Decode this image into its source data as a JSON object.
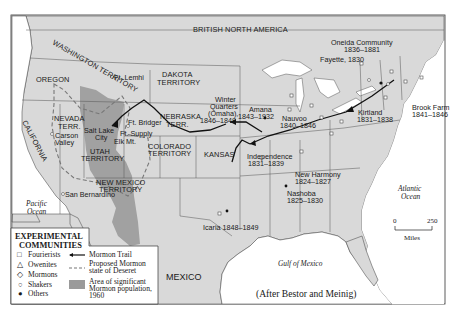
{
  "map": {
    "colors": {
      "land": "#d9d9d9",
      "water": "#ffffff",
      "border": "#555555",
      "mormon_area": "#9a9a9a",
      "trail": "#111111"
    },
    "regions": {
      "british_north_america": "BRITISH NORTH AMERICA",
      "washington": "WASHINGTON TERRITORY",
      "oregon": "OREGON",
      "dakota_1": "DAKOTA",
      "dakota_2": "TERRITORY",
      "nevada_1": "NEVADA",
      "nevada_2": "TERR.",
      "nebraska_1": "NEBRASKA",
      "nebraska_2": "TERR.",
      "utah_1": "UTAH",
      "utah_2": "TERRITORY",
      "colorado_1": "COLORADO",
      "colorado_2": "TERRITORY",
      "kansas": "KANSAS",
      "california": "CALIFORNIA",
      "new_mexico_1": "NEW MEXICO",
      "new_mexico_2": "TERRITORY",
      "mexico": "MEXICO"
    },
    "places": {
      "ft_lemhi": "Ft. Lemhi",
      "ft_bridger": "Ft. Bridger",
      "ft_supply": "Ft. Supply",
      "salt_lake_1": "Salt Lake",
      "salt_lake_2": "City",
      "elk_mt": "Elk Mt.",
      "carson_1": "Carson",
      "carson_2": "Valley",
      "san_bernardino": "San Bernardino",
      "winter_quarters_1": "Winter",
      "winter_quarters_2": "Quarters",
      "winter_quarters_3": "(Omaha),",
      "winter_quarters_4": "1846–1848",
      "amana_1": "Amana",
      "amana_2": "1843–1932",
      "nauvoo_1": "Nauvoo",
      "nauvoo_2": "1840–1846",
      "independence_1": "Independence",
      "independence_2": "1831–1839",
      "oneida_1": "Oneida Community",
      "oneida_2": "1836–1881",
      "fayette": "Fayette, 1830",
      "kirtland_1": "Kirtland",
      "kirtland_2": "1831–1838",
      "brook_farm_1": "Brook Farm",
      "brook_farm_2": "1841–1846",
      "new_harmony_1": "New Harmony",
      "new_harmony_2": "1824–1827",
      "nashoba_1": "Nashoba",
      "nashoba_2": "1825–1830",
      "icaria": "Icaria 1848–1849"
    },
    "water_bodies": {
      "pacific_1": "Pacific",
      "pacific_2": "Ocean",
      "atlantic_1": "Atlantic",
      "atlantic_2": "Ocean",
      "gulf": "Gulf of Mexico"
    },
    "scale": {
      "min": "0",
      "max": "250",
      "unit": "Miles"
    },
    "credit": "(After Bestor and Meinig)"
  },
  "legend": {
    "title_1": "EXPERIMENTAL",
    "title_2": "COMMUNITIES",
    "symbols": [
      {
        "glyph": "□",
        "label": "Fourierists"
      },
      {
        "glyph": "△",
        "label": "Owenites"
      },
      {
        "glyph": "◇",
        "label": "Mormons"
      },
      {
        "glyph": "○",
        "label": "Shakers"
      },
      {
        "glyph": "●",
        "label": "Others"
      }
    ],
    "lines": {
      "trail": "Mormon Trail",
      "deseret_1": "Proposed Mormon",
      "deseret_2": "state of Deseret",
      "area_1": "Area of significant",
      "area_2": "Mormon population,",
      "area_3": "1960"
    }
  }
}
